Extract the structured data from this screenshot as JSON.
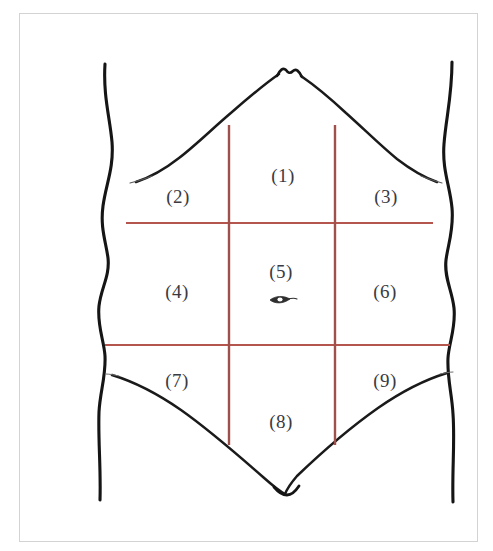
{
  "figure": {
    "background_color": "#ffffff",
    "frame_color": "#d3d3d3",
    "outline_color": "#1a1a1a",
    "thin_outline_color": "#3c3c3c",
    "grid_color": "#b5564e",
    "grid_color_vertical": "#a0504a",
    "label_color": "#3a3a42"
  },
  "regions": [
    {
      "id": "region-1",
      "label": "(1)",
      "x": 283,
      "y": 175
    },
    {
      "id": "region-2",
      "label": "(2)",
      "x": 178,
      "y": 196
    },
    {
      "id": "region-3",
      "label": "(3)",
      "x": 386,
      "y": 196
    },
    {
      "id": "region-4",
      "label": "(4)",
      "x": 177,
      "y": 291
    },
    {
      "id": "region-5",
      "label": "(5)",
      "x": 281,
      "y": 271
    },
    {
      "id": "region-6",
      "label": "(6)",
      "x": 385,
      "y": 291
    },
    {
      "id": "region-7",
      "label": "(7)",
      "x": 177,
      "y": 380
    },
    {
      "id": "region-8",
      "label": "(8)",
      "x": 281,
      "y": 421
    },
    {
      "id": "region-9",
      "label": "(9)",
      "x": 385,
      "y": 380
    }
  ],
  "grid": {
    "vertical_lines": [
      {
        "id": "vertical-left",
        "x": 229,
        "y1": 125,
        "y2": 445
      },
      {
        "id": "vertical-right",
        "x": 335,
        "y1": 125,
        "y2": 445
      }
    ],
    "horizontal_lines": [
      {
        "id": "horizontal-upper",
        "y": 223,
        "x1": 126,
        "x2": 433
      },
      {
        "id": "horizontal-lower",
        "y": 345,
        "x1": 105,
        "x2": 450
      }
    ]
  },
  "navel": {
    "id": "navel",
    "x": 281,
    "y": 300
  }
}
